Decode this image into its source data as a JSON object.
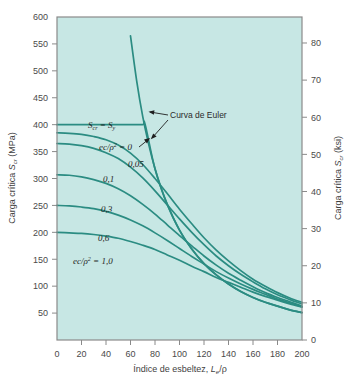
{
  "figure": {
    "background_color": "#ffffff",
    "plot_background_color": "#c7e7e4",
    "curve_color": "#2b8c82",
    "frame_color": "#8a8a8a",
    "text_color": "#3a3a3a"
  },
  "axes": {
    "left": {
      "title_parts": {
        "main": "Carga crítica ",
        "sym": "S",
        "sub": "cr",
        "unit": " (MPa)"
      },
      "title": "Carga crítica Scr (MPa)",
      "unit": "MPa",
      "min": 0,
      "max": 600,
      "ticks": [
        50,
        100,
        150,
        200,
        250,
        300,
        350,
        400,
        450,
        500,
        550,
        600
      ],
      "tick_labels": [
        "50",
        "100",
        "150",
        "200",
        "250",
        "300",
        "350",
        "400",
        "450",
        "500",
        "550",
        "600"
      ]
    },
    "right": {
      "title_parts": {
        "main": "Carga crítica ",
        "sym": "S",
        "sub": "cr",
        "unit": " (ksi)"
      },
      "title": "Carga crítica Scr (ksi)",
      "unit": "ksi",
      "min": 0,
      "max": 87,
      "ticks": [
        0,
        10,
        20,
        30,
        40,
        50,
        60,
        70,
        80
      ],
      "tick_labels": [
        "0",
        "10",
        "20",
        "30",
        "40",
        "50",
        "60",
        "70",
        "80"
      ]
    },
    "bottom": {
      "title_parts": {
        "main": "Índice de esbeltez, ",
        "sym": "L",
        "sub": "e",
        "unit": "/ρ"
      },
      "title": "Índice de esbeltez, Le/ρ",
      "min": 0,
      "max": 200,
      "ticks": [
        0,
        20,
        40,
        60,
        80,
        100,
        120,
        140,
        160,
        180,
        200
      ],
      "tick_labels": [
        "0",
        "20",
        "40",
        "60",
        "80",
        "100",
        "120",
        "140",
        "160",
        "180",
        "200"
      ]
    }
  },
  "annotations": {
    "yield_label": "Scr = Sy",
    "yield_parts": {
      "s1": "S",
      "sub1": "cr",
      "eq": " = ",
      "s2": "S",
      "sub2": "y"
    },
    "euler_label": "Curva de Euler",
    "eccentricity_first": "ec/ρ² = 0",
    "eccentricity_first_parts": {
      "ec": "ec",
      "rho": "/ρ",
      "sup": "2",
      "eq": " = 0"
    },
    "eccentricity_last": "ec/ρ² = 1,0",
    "eccentricity_last_parts": {
      "ec": "ec",
      "rho": "/ρ",
      "sup": "2",
      "eq": " = 1,0"
    },
    "curve_labels": [
      "0,05",
      "0,1",
      "0,3",
      "0,6"
    ]
  },
  "chart_data": {
    "type": "line",
    "title": "",
    "xlabel": "Índice de esbeltez, Le/ρ",
    "ylabel": "Carga crítica Scr (MPa)",
    "ylabel_right": "Carga crítica Scr (ksi)",
    "xlim": [
      0,
      200
    ],
    "ylim": [
      0,
      600
    ],
    "ylim_right": [
      0,
      87
    ],
    "grid": false,
    "legend": "inline-annotations",
    "x": [
      0,
      10,
      20,
      30,
      40,
      50,
      60,
      70,
      80,
      90,
      100,
      110,
      120,
      130,
      140,
      150,
      160,
      170,
      180,
      190,
      200
    ],
    "series": [
      {
        "name": "Curva de Euler",
        "label": "Curva de Euler",
        "x": [
          60,
          65,
          70,
          75,
          80,
          85,
          90,
          100,
          110,
          120,
          130,
          140,
          150,
          160,
          170,
          180,
          190,
          200
        ],
        "values": [
          565,
          482,
          415,
          362,
          318,
          282,
          252,
          204,
          169,
          142,
          121,
          104,
          90,
          79,
          70,
          63,
          56,
          51
        ]
      },
      {
        "name": "ec/rho2 = 0",
        "label": "ec/ρ² = 0",
        "x": [
          0,
          10,
          20,
          30,
          40,
          50,
          60,
          70,
          72,
          80,
          90,
          100,
          110,
          120,
          130,
          140,
          150,
          160,
          170,
          180,
          190,
          200
        ],
        "values": [
          400,
          400,
          400,
          400,
          400,
          400,
          400,
          400,
          400,
          318,
          252,
          204,
          169,
          142,
          121,
          104,
          90,
          79,
          70,
          63,
          56,
          51
        ]
      },
      {
        "name": "ec/rho2 = 0,05",
        "label": "0,05",
        "values": [
          385,
          384,
          382,
          378,
          372,
          362,
          347,
          326,
          300,
          272,
          243,
          216,
          190,
          167,
          147,
          129,
          113,
          100,
          88,
          78,
          70
        ]
      },
      {
        "name": "ec/rho2 = 0,1",
        "label": "0,1",
        "values": [
          365,
          364,
          361,
          356,
          348,
          337,
          321,
          301,
          277,
          251,
          225,
          200,
          177,
          156,
          138,
          122,
          108,
          95,
          84,
          75,
          67
        ]
      },
      {
        "name": "ec/rho2 = 0,3",
        "label": "0,3",
        "values": [
          307,
          306,
          303,
          298,
          291,
          281,
          268,
          252,
          234,
          214,
          194,
          175,
          156,
          139,
          124,
          111,
          99,
          88,
          79,
          71,
          63
        ]
      },
      {
        "name": "ec/rho2 = 0,6",
        "label": "0,6",
        "values": [
          250,
          249,
          247,
          244,
          239,
          232,
          223,
          212,
          199,
          185,
          170,
          155,
          141,
          127,
          115,
          104,
          94,
          85,
          76,
          69,
          62
        ]
      },
      {
        "name": "ec/rho2 = 1,0",
        "label": "ec/ρ² = 1,0",
        "values": [
          200,
          199,
          198,
          196,
          193,
          189,
          183,
          176,
          168,
          158,
          148,
          137,
          127,
          116,
          107,
          98,
          89,
          81,
          74,
          67,
          61
        ]
      }
    ]
  }
}
